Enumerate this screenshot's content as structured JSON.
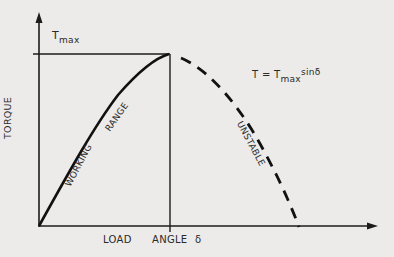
{
  "diagram": {
    "type": "torque-angle curve",
    "y_axis_label": "TORQUE",
    "x_axis_label_parts": [
      "LOAD",
      "ANGLE",
      "δ"
    ],
    "tmax_label": {
      "main": "T",
      "sub": "max"
    },
    "equation": {
      "lhs": "T = T",
      "sub": "max",
      "sup": "sinδ"
    },
    "regions": [
      {
        "label_parts": [
          "WORKING",
          "RANGE"
        ],
        "style": "solid"
      },
      {
        "label": "UNSTABLE",
        "style": "dashed"
      }
    ],
    "colors": {
      "background": "#ecebe9",
      "ink": "#1c1c1c"
    }
  }
}
